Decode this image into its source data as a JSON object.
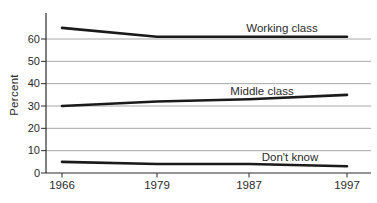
{
  "chart_data": {
    "type": "line",
    "title": "",
    "xlabel": "",
    "ylabel": "Percent",
    "categories": [
      "1966",
      "1979",
      "1987",
      "1997"
    ],
    "series": [
      {
        "name": "Working class",
        "values": [
          65,
          61,
          61,
          61
        ]
      },
      {
        "name": "Middle class",
        "values": [
          30,
          32,
          33,
          35
        ]
      },
      {
        "name": "Don't know",
        "values": [
          5,
          4,
          4,
          3
        ]
      }
    ],
    "ylim": [
      0,
      72
    ],
    "yticks": [
      0,
      10,
      20,
      30,
      40,
      50,
      60
    ],
    "grid": "horizontal",
    "legend": "inline-labels",
    "line_color": "#1a1a1a",
    "axis_color": "#2b2b2b",
    "grid_color": "#a8a8a8",
    "text_color": "#2b2b2b",
    "background": "#ffffff"
  }
}
